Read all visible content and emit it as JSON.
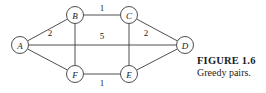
{
  "figure": {
    "caption_title": "FIGURE 1.6",
    "caption_text": "Greedy pairs.",
    "colors": {
      "stroke": "#3a3a3a",
      "text": "#1a1a1a",
      "background": "#ffffff"
    }
  },
  "chart_data": {
    "type": "diagram",
    "title": "FIGURE 1.6",
    "subtitle": "Greedy pairs.",
    "graph_type": "undirected weighted graph",
    "nodes": [
      {
        "id": "A",
        "label": "A",
        "x": 20,
        "y": 45,
        "r": 8.5
      },
      {
        "id": "B",
        "label": "B",
        "x": 75,
        "y": 15,
        "r": 8.5
      },
      {
        "id": "C",
        "label": "C",
        "x": 129,
        "y": 15,
        "r": 8.5
      },
      {
        "id": "D",
        "label": "D",
        "x": 185,
        "y": 45,
        "r": 8.5
      },
      {
        "id": "E",
        "label": "E",
        "x": 129,
        "y": 74,
        "r": 8.5
      },
      {
        "id": "F",
        "label": "F",
        "x": 75,
        "y": 74,
        "r": 8.5
      }
    ],
    "edges": [
      {
        "from": "A",
        "to": "B",
        "weight": "2",
        "label_x": 50,
        "label_y": 33
      },
      {
        "from": "B",
        "to": "C",
        "weight": "1",
        "label_x": 102,
        "label_y": 8
      },
      {
        "from": "C",
        "to": "D",
        "weight": "2",
        "label_x": 146,
        "label_y": 33
      },
      {
        "from": "A",
        "to": "D",
        "weight": "5",
        "label_x": 102,
        "label_y": 36
      },
      {
        "from": "A",
        "to": "F",
        "weight": "",
        "label_x": 0,
        "label_y": 0
      },
      {
        "from": "F",
        "to": "E",
        "weight": "1",
        "label_x": 102,
        "label_y": 83
      },
      {
        "from": "E",
        "to": "D",
        "weight": "",
        "label_x": 0,
        "label_y": 0
      },
      {
        "from": "B",
        "to": "F",
        "weight": "",
        "label_x": 0,
        "label_y": 0
      },
      {
        "from": "C",
        "to": "E",
        "weight": "",
        "label_x": 0,
        "label_y": 0
      }
    ],
    "edge_labels": [
      "2",
      "1",
      "2",
      "5",
      "1"
    ],
    "node_labels": [
      "A",
      "B",
      "C",
      "D",
      "E",
      "F"
    ]
  }
}
